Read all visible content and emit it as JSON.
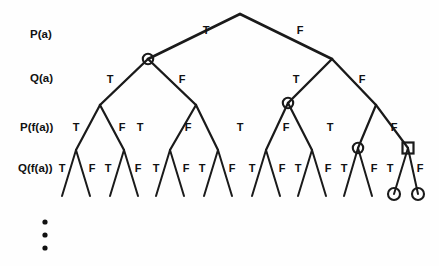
{
  "figure": {
    "background_color": "#fefefe",
    "line_color": "#1a1a1a",
    "text_color": "#111111"
  },
  "row_labels": [
    {
      "id": "row-p-a",
      "text": "P(a)",
      "x": 30,
      "y": 38,
      "level": 1
    },
    {
      "id": "row-q-a",
      "text": "Q(a)",
      "x": 30,
      "y": 82,
      "level": 2
    },
    {
      "id": "row-p-fa",
      "text": "P(f(a))",
      "x": 20,
      "y": 131,
      "level": 3
    },
    {
      "id": "row-q-fa",
      "text": "Q(f(a))",
      "x": 18,
      "y": 172,
      "level": 4
    }
  ],
  "edge_labels": {
    "level1": [
      {
        "text": "T",
        "x": 206,
        "y": 34
      },
      {
        "text": "F",
        "x": 300,
        "y": 34
      }
    ],
    "level2": [
      {
        "text": "T",
        "x": 110,
        "y": 83
      },
      {
        "text": "F",
        "x": 182,
        "y": 83
      },
      {
        "text": "T",
        "x": 296,
        "y": 83
      },
      {
        "text": "F",
        "x": 362,
        "y": 83
      }
    ],
    "level3": [
      {
        "text": "T",
        "x": 76,
        "y": 131
      },
      {
        "text": "F",
        "x": 122,
        "y": 131
      },
      {
        "text": "T",
        "x": 140,
        "y": 131
      },
      {
        "text": "F",
        "x": 188,
        "y": 131
      },
      {
        "text": "T",
        "x": 240,
        "y": 131
      },
      {
        "text": "F",
        "x": 286,
        "y": 131
      },
      {
        "text": "T",
        "x": 330,
        "y": 131
      },
      {
        "text": "F",
        "x": 394,
        "y": 131
      }
    ],
    "level4": [
      {
        "text": "T",
        "x": 62,
        "y": 172
      },
      {
        "text": "F",
        "x": 92,
        "y": 172
      },
      {
        "text": "T",
        "x": 108,
        "y": 172
      },
      {
        "text": "F",
        "x": 138,
        "y": 172
      },
      {
        "text": "T",
        "x": 156,
        "y": 172
      },
      {
        "text": "F",
        "x": 186,
        "y": 172
      },
      {
        "text": "T",
        "x": 202,
        "y": 172
      },
      {
        "text": "F",
        "x": 232,
        "y": 172
      },
      {
        "text": "T",
        "x": 252,
        "y": 172
      },
      {
        "text": "F",
        "x": 282,
        "y": 172
      },
      {
        "text": "T",
        "x": 298,
        "y": 172
      },
      {
        "text": "F",
        "x": 328,
        "y": 172
      },
      {
        "text": "T",
        "x": 344,
        "y": 172
      },
      {
        "text": "F",
        "x": 374,
        "y": 172
      },
      {
        "text": "T",
        "x": 390,
        "y": 172
      },
      {
        "text": "F",
        "x": 420,
        "y": 172
      }
    ]
  },
  "nodes": {
    "root": {
      "x": 240,
      "y": 14
    },
    "level2": [
      {
        "id": "n-T",
        "x": 148,
        "y": 59,
        "marker": "circle"
      },
      {
        "id": "n-F",
        "x": 332,
        "y": 59,
        "marker": "none"
      }
    ],
    "level3": [
      {
        "id": "n-TT",
        "x": 100,
        "y": 105,
        "marker": "none"
      },
      {
        "id": "n-TF",
        "x": 196,
        "y": 105,
        "marker": "none"
      },
      {
        "id": "n-FT",
        "x": 288,
        "y": 103,
        "marker": "circle"
      },
      {
        "id": "n-FF",
        "x": 376,
        "y": 105,
        "marker": "none"
      }
    ],
    "level4": [
      {
        "id": "n-TTT",
        "x": 76,
        "y": 150,
        "marker": "none"
      },
      {
        "id": "n-TTF",
        "x": 124,
        "y": 150,
        "marker": "none"
      },
      {
        "id": "n-TFT",
        "x": 170,
        "y": 150,
        "marker": "none"
      },
      {
        "id": "n-TFF",
        "x": 218,
        "y": 150,
        "marker": "none"
      },
      {
        "id": "n-FTT",
        "x": 266,
        "y": 150,
        "marker": "none"
      },
      {
        "id": "n-FTF",
        "x": 312,
        "y": 150,
        "marker": "none"
      },
      {
        "id": "n-FFT",
        "x": 358,
        "y": 148,
        "marker": "circle"
      },
      {
        "id": "n-FFF",
        "x": 408,
        "y": 148,
        "marker": "square"
      }
    ],
    "leaves": [
      {
        "x": 62,
        "y": 196,
        "marker": "none"
      },
      {
        "x": 90,
        "y": 196,
        "marker": "none"
      },
      {
        "x": 110,
        "y": 196,
        "marker": "none"
      },
      {
        "x": 138,
        "y": 196,
        "marker": "none"
      },
      {
        "x": 156,
        "y": 196,
        "marker": "none"
      },
      {
        "x": 184,
        "y": 196,
        "marker": "none"
      },
      {
        "x": 204,
        "y": 196,
        "marker": "none"
      },
      {
        "x": 232,
        "y": 196,
        "marker": "none"
      },
      {
        "x": 252,
        "y": 196,
        "marker": "none"
      },
      {
        "x": 280,
        "y": 196,
        "marker": "none"
      },
      {
        "x": 298,
        "y": 196,
        "marker": "none"
      },
      {
        "x": 326,
        "y": 196,
        "marker": "none"
      },
      {
        "x": 344,
        "y": 196,
        "marker": "none"
      },
      {
        "x": 372,
        "y": 196,
        "marker": "none"
      },
      {
        "x": 394,
        "y": 194,
        "marker": "circle"
      },
      {
        "x": 418,
        "y": 194,
        "marker": "circle"
      }
    ]
  },
  "markers": {
    "circle_radius": 5.2,
    "leaf_circle_radius": 6.0,
    "square_size": 11
  },
  "ellipsis": {
    "label": "vertical-ellipsis",
    "x": 45,
    "dots": [
      222,
      235,
      248
    ],
    "radius": 2.6
  }
}
